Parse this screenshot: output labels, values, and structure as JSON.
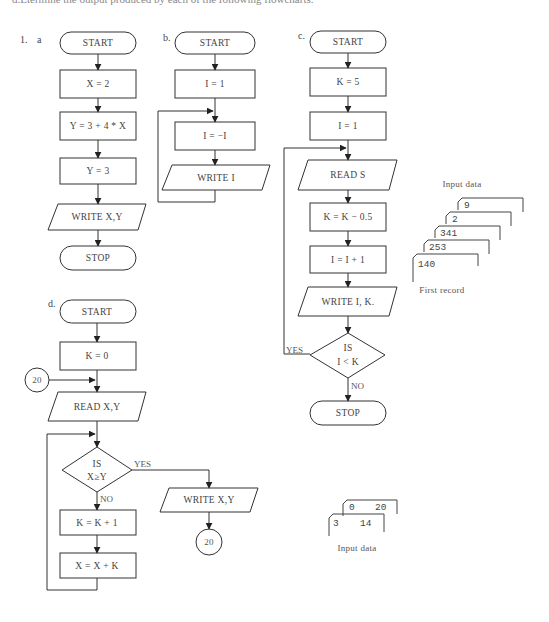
{
  "header": {
    "text": "d.Etermine the output produced by each of the following flowcharts."
  },
  "problem_number": "1.",
  "flowcharts": {
    "a": {
      "label": "a",
      "steps": [
        "START",
        "X = 2",
        "Y = 3 + 4 * X",
        "Y = 3",
        "WRITE X,Y",
        "STOP"
      ]
    },
    "b": {
      "label": "b.",
      "steps": [
        "START",
        "I = 1",
        "I = −I",
        "WRITE I"
      ]
    },
    "c": {
      "label": "c.",
      "steps": [
        "START",
        "K = 5",
        "I = 1",
        "READ S",
        "K = K − 0.5",
        "I = I + 1",
        "WRITE I, K."
      ],
      "decision": {
        "line1": "IS",
        "line2": "I < K",
        "yes": "YES",
        "no": "NO"
      },
      "end": "STOP",
      "input_caption": "Input data",
      "first_record_caption": "First record",
      "cards": [
        "9",
        "2",
        "341",
        "253",
        "140"
      ]
    },
    "d": {
      "label": "d.",
      "steps": [
        "START",
        "K = 0",
        "READ X,Y",
        "K = K + 1",
        "X = X + K"
      ],
      "connector_in": "20",
      "decision": {
        "line1": "IS",
        "line2": "X≥Y",
        "yes": "YES",
        "no": "NO"
      },
      "write": "WRITE X,Y",
      "connector_out": "20",
      "input_caption": "Input data",
      "cards": [
        {
          "a": "0",
          "b": "20"
        },
        {
          "a": "3",
          "b": "14"
        }
      ]
    }
  }
}
